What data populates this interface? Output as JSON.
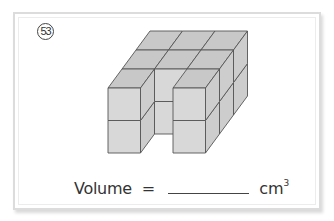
{
  "problem": {
    "number": "53",
    "number_display": "53",
    "formula": {
      "label": "Volume",
      "equals": "=",
      "answer": "",
      "unit": "cm",
      "unit_exponent": "3"
    }
  },
  "figure": {
    "grid": {
      "width": 3,
      "depth": 3,
      "height": 2
    },
    "removed_columns": [
      {
        "x": 1,
        "z": 0
      }
    ],
    "cube_count": 16,
    "origin": [
      108,
      153
    ],
    "cube_size": 32.5,
    "depth_offset": [
      14,
      -19
    ],
    "colors": {
      "front": "#d8d8d8",
      "side": "#cdcdcd",
      "top": "#c8c8c8",
      "edge": "#555555"
    }
  },
  "colors": {
    "card_border": "#dcdcdc",
    "text": "#333333"
  }
}
